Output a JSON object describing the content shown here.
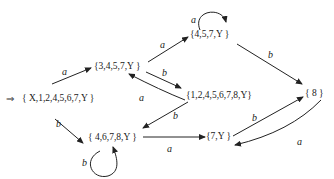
{
  "diagram": {
    "type": "DFA state transition diagram",
    "start_marker": "⇒",
    "nodes": [
      {
        "id": "s0",
        "label": "{ X,1,2,4,5,6,7,Y }",
        "start": true
      },
      {
        "id": "s1",
        "label": "{3,4,5,7,Y }"
      },
      {
        "id": "s2",
        "label": "{4,5,7,Y }"
      },
      {
        "id": "s3",
        "label": "{1,2,4,5,6,7,8,Y}"
      },
      {
        "id": "s4",
        "label": "{ 4,6,7,8,Y }"
      },
      {
        "id": "s5",
        "label": "{7,Y }"
      },
      {
        "id": "s6",
        "label": "{ 8 }"
      }
    ],
    "edges": [
      {
        "from": "s0",
        "to": "s1",
        "label": "a"
      },
      {
        "from": "s0",
        "to": "s4",
        "label": "b"
      },
      {
        "from": "s1",
        "to": "s2",
        "label": "a"
      },
      {
        "from": "s1",
        "to": "s3",
        "label": "b"
      },
      {
        "from": "s3",
        "to": "s1",
        "label": "a"
      },
      {
        "from": "s2",
        "to": "s2",
        "label": "a"
      },
      {
        "from": "s2",
        "to": "s6",
        "label": "b"
      },
      {
        "from": "s3",
        "to": "s4",
        "label": "b"
      },
      {
        "from": "s4",
        "to": "s4",
        "label": "b"
      },
      {
        "from": "s4",
        "to": "s5",
        "label": "a"
      },
      {
        "from": "s5",
        "to": "s6",
        "label": "b"
      },
      {
        "from": "s6",
        "to": "s5",
        "label": "a"
      }
    ]
  }
}
